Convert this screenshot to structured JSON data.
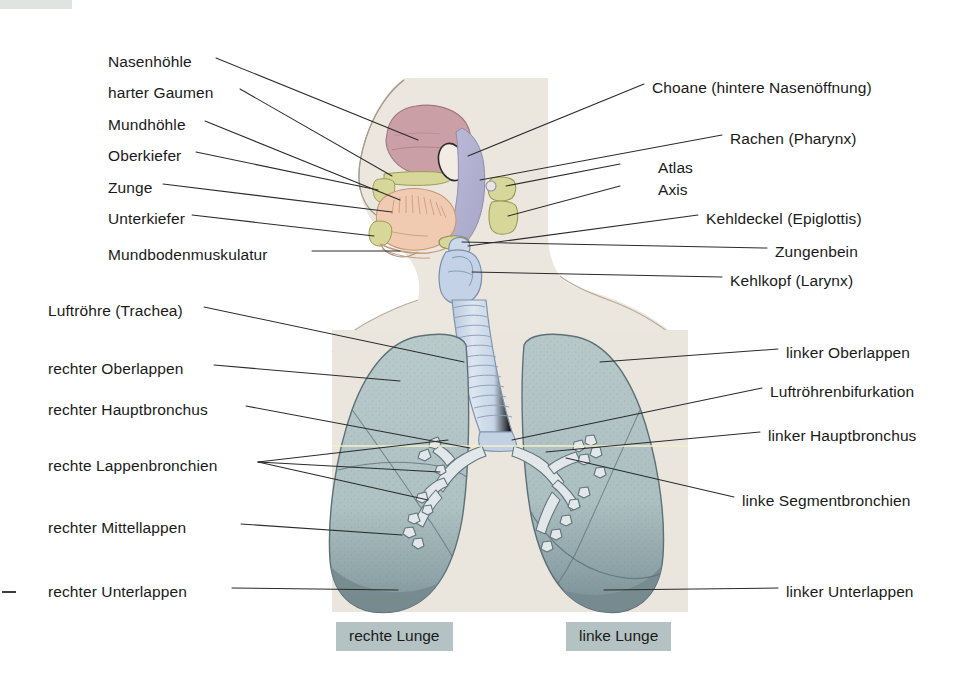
{
  "figure": {
    "background_color": "#ffffff",
    "body_silhouette_color": "#ece7de",
    "thorax_panel_color": "#ebe6dd",
    "lung_color": "#b3c5c6",
    "lung_base_color": "#7e9195",
    "trachea_color": "#ccd8e8",
    "nasal_cavity_color": "#c89aa2",
    "pharynx_color": "#b0aed0",
    "bone_color": "#d8d79a",
    "tongue_color": "#f0cbb2",
    "chip_color": "#b5c2c4"
  },
  "labels_left": [
    {
      "id": "nasenhoehle",
      "text": "Nasenhöhle",
      "x": 108,
      "y": 62
    },
    {
      "id": "harter-gaumen",
      "text": "harter Gaumen",
      "x": 108,
      "y": 93
    },
    {
      "id": "mundhoehle",
      "text": "Mundhöhle",
      "x": 108,
      "y": 125
    },
    {
      "id": "oberkiefer",
      "text": "Oberkiefer",
      "x": 108,
      "y": 156
    },
    {
      "id": "zunge",
      "text": "Zunge",
      "x": 108,
      "y": 188
    },
    {
      "id": "unterkiefer",
      "text": "Unterkiefer",
      "x": 108,
      "y": 219
    },
    {
      "id": "mundbodenmuskulatur",
      "text": "Mundbodenmuskulatur",
      "x": 108,
      "y": 255
    },
    {
      "id": "luftroehre-trachea",
      "text": "Luftröhre (Trachea)",
      "x": 48,
      "y": 311
    },
    {
      "id": "rechter-oberlappen",
      "text": "rechter Oberlappen",
      "x": 48,
      "y": 369
    },
    {
      "id": "rechter-hauptbronchus",
      "text": "rechter Hauptbronchus",
      "x": 48,
      "y": 410
    },
    {
      "id": "rechte-lappenbronchien",
      "text": "rechte Lappenbronchien",
      "x": 48,
      "y": 466
    },
    {
      "id": "rechter-mittellappen",
      "text": "rechter Mittellappen",
      "x": 48,
      "y": 528
    },
    {
      "id": "rechter-unterlappen",
      "text": "rechter Unterlappen",
      "x": 48,
      "y": 592
    }
  ],
  "labels_right": [
    {
      "id": "choane",
      "text": "Choane (hintere Nasenöffnung)",
      "x": 652,
      "y": 88
    },
    {
      "id": "rachen-pharynx",
      "text": "Rachen (Pharynx)",
      "x": 730,
      "y": 139
    },
    {
      "id": "atlas",
      "text": "Atlas",
      "x": 658,
      "y": 168
    },
    {
      "id": "axis",
      "text": "Axis",
      "x": 658,
      "y": 190
    },
    {
      "id": "kehldeckel-epiglottis",
      "text": "Kehldeckel (Epiglottis)",
      "x": 706,
      "y": 219
    },
    {
      "id": "zungenbein",
      "text": "Zungenbein",
      "x": 775,
      "y": 252
    },
    {
      "id": "kehlkopf-larynx",
      "text": "Kehlkopf (Larynx)",
      "x": 730,
      "y": 281
    },
    {
      "id": "linker-oberlappen",
      "text": "linker Oberlappen",
      "x": 786,
      "y": 353
    },
    {
      "id": "luftroehrenbifurkation",
      "text": "Luftröhrenbifurkation",
      "x": 770,
      "y": 392
    },
    {
      "id": "linker-hauptbronchus",
      "text": "linker Hauptbronchus",
      "x": 768,
      "y": 436
    },
    {
      "id": "linke-segmentbronchien",
      "text": "linke Segmentbronchien",
      "x": 742,
      "y": 501
    },
    {
      "id": "linker-unterlappen",
      "text": "linker Unterlappen",
      "x": 786,
      "y": 592
    }
  ],
  "captions": [
    {
      "id": "rechte-lunge",
      "text": "rechte Lunge",
      "x": 336,
      "y": 628
    },
    {
      "id": "linke-lunge",
      "text": "linke Lunge",
      "x": 566,
      "y": 628
    }
  ]
}
